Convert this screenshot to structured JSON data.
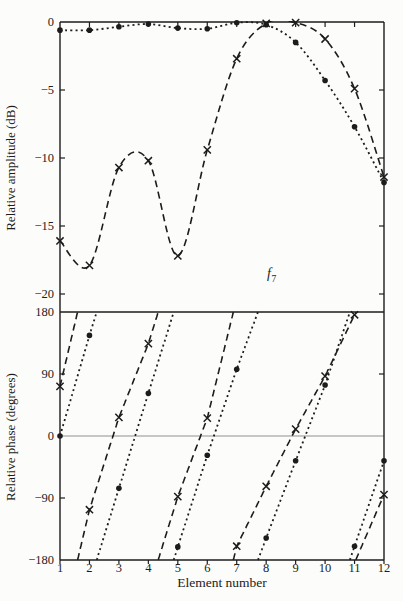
{
  "figure": {
    "background": "#fcfcfa",
    "ink_color": "#1c1c1c",
    "zero_line_color": "#8f8f8f",
    "annotation": {
      "text": "f",
      "subscript": "7",
      "color": "#7b7b78"
    }
  },
  "chart_data": {
    "type": "line",
    "title": "",
    "xlabel": "Element number",
    "x": [
      1,
      2,
      3,
      4,
      5,
      6,
      7,
      8,
      9,
      10,
      11,
      12
    ],
    "x_labels": [
      "1",
      "2",
      "3",
      "4",
      "5",
      "6",
      "7",
      "8",
      "9",
      "10",
      "11",
      "12"
    ],
    "legend": "none",
    "grid": "off",
    "panels": [
      {
        "name": "relative-amplitude",
        "ylabel": "Relative amplitude (dB)",
        "ylim": [
          -20,
          0
        ],
        "yticks": [
          0,
          -5,
          -10,
          -15,
          -20
        ],
        "ytick_labels": [
          "0",
          "−5",
          "−10",
          "−15",
          "−20"
        ],
        "series": [
          {
            "name": "dashed-x-series",
            "line": "dashed",
            "marker": "x",
            "values": [
              -16.1,
              -17.9,
              -10.7,
              -10.2,
              -17.2,
              -9.4,
              -2.7,
              -0.1,
              -0.05,
              -1.25,
              -4.9,
              -11.4
            ]
          },
          {
            "name": "dotted-dot-series",
            "line": "dotted",
            "marker": "dot",
            "values": [
              -0.6,
              -0.6,
              -0.35,
              -0.15,
              -0.45,
              -0.5,
              -0.05,
              -0.2,
              -1.5,
              -4.3,
              -7.7,
              -11.8
            ]
          }
        ]
      },
      {
        "name": "relative-phase",
        "ylabel": "Relative phase (degrees)",
        "ylim": [
          -180,
          180
        ],
        "yticks": [
          180,
          90,
          0,
          -90,
          -180
        ],
        "ytick_labels": [
          "180",
          "90",
          "0",
          "−90",
          "−180"
        ],
        "wrap_degrees": 360,
        "reference_lines": [
          180,
          0,
          -180
        ],
        "series": [
          {
            "name": "dashed-x-series",
            "line": "dashed",
            "marker": "x",
            "values": [
              72,
              -107,
              27,
              134,
              -88,
              26,
              -160,
              -73,
              10,
              87,
              176,
              -85
            ]
          },
          {
            "name": "dotted-dot-series",
            "line": "dotted",
            "marker": "dot",
            "values": [
              0,
              146,
              -76,
              62,
              -161,
              -28,
              97,
              -148,
              -36,
              74,
              -160,
              -36
            ]
          }
        ]
      }
    ]
  }
}
